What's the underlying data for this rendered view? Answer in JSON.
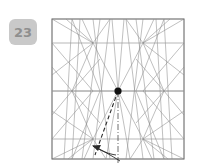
{
  "step": {
    "number": "23",
    "badge_color": "#c9c9c9",
    "badge_text_color": "#8f8f8f"
  },
  "diagram": {
    "paper_outline_color": "#5a5a5a",
    "crease_color": "#8c8c8c",
    "reference_line_color": "#9a9a9a",
    "fold_line_color": "#2a2a2a",
    "axis_color": "#4a4a4a",
    "marker_color": "#111111",
    "background": "#ffffff",
    "labels": {
      "dot": "reference point",
      "axis": "center axis (dash-dot)",
      "fold": "valley fold (dashed)",
      "arrow": "fold direction arrow"
    },
    "geometry": {
      "square": {
        "x": 4,
        "y": 4,
        "width": 132,
        "height": 140
      },
      "reference_rows_y": [
        28,
        76,
        124
      ],
      "center_dot": {
        "x": 70,
        "y": 76,
        "r": 3.6
      },
      "star_vertices": [
        {
          "x": 24,
          "y": 76
        },
        {
          "x": 116,
          "y": 76
        }
      ],
      "fan_nodes": [
        {
          "x": 45,
          "y": 28
        },
        {
          "x": 95,
          "y": 28
        },
        {
          "x": 45,
          "y": 124
        },
        {
          "x": 95,
          "y": 124
        }
      ],
      "axis_line": {
        "x": 70,
        "y1": 76,
        "y2": 148
      },
      "fold_dashed": {
        "x1": 70,
        "y1": 76,
        "x2": 47,
        "y2": 140
      },
      "arrow_tip": {
        "x": 44,
        "y": 131
      }
    }
  }
}
